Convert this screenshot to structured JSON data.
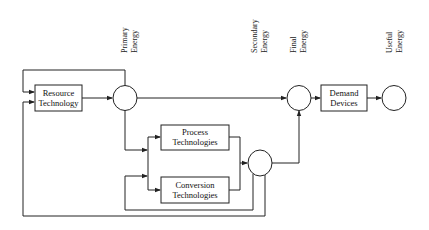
{
  "diagram": {
    "stages": [
      {
        "id": "primary",
        "line1": "Primary",
        "line2": "Energy"
      },
      {
        "id": "secondary",
        "line1": "Secondary",
        "line2": "Energy"
      },
      {
        "id": "final",
        "line1": "Final",
        "line2": "Energy"
      },
      {
        "id": "useful",
        "line1": "Useful",
        "line2": "Energy"
      }
    ],
    "boxes": {
      "resource": {
        "line1": "Resource",
        "line2": "Technology"
      },
      "process": {
        "line1": "Process",
        "line2": "Technologies"
      },
      "conversion": {
        "line1": "Conversion",
        "line2": "Technologies"
      },
      "demand": {
        "line1": "Demand",
        "line2": "Devices"
      }
    },
    "colors": {
      "stroke": "#222222",
      "background": "#ffffff"
    }
  }
}
